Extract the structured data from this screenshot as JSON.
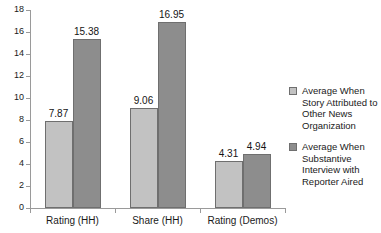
{
  "chart_data": {
    "type": "bar",
    "title": "",
    "subtitle": "",
    "xlabel": "",
    "ylabel": "",
    "categories": [
      "Rating (HH)",
      "Share (HH)",
      "Rating (Demos)"
    ],
    "series": [
      {
        "name": "Average When Story Attributed to Other News Organization",
        "color": "#c2c2c2",
        "values": [
          7.87,
          9.06,
          4.31
        ],
        "labels": [
          "7.87",
          "9.06",
          "4.31"
        ]
      },
      {
        "name": "Average When Substantive Interview with Reporter Aired",
        "color": "#8d8d8d",
        "values": [
          15.38,
          16.95,
          4.94
        ],
        "labels": [
          "15.38",
          "16.95",
          "4.94"
        ]
      }
    ],
    "ylim": [
      0,
      18
    ],
    "ytick_labels": [
      "0",
      "2",
      "4",
      "6",
      "8",
      "10",
      "12",
      "14",
      "16",
      "18"
    ],
    "ytick_values": [
      0,
      2,
      4,
      6,
      8,
      10,
      12,
      14,
      16,
      18
    ],
    "grid": false,
    "legend_position": "right"
  },
  "axis": {
    "ticks": [
      {
        "label": "18",
        "value": 18
      },
      {
        "label": "16",
        "value": 16
      },
      {
        "label": "14",
        "value": 14
      },
      {
        "label": "12",
        "value": 12
      },
      {
        "label": "10",
        "value": 10
      },
      {
        "label": "8",
        "value": 8
      },
      {
        "label": "6",
        "value": 6
      },
      {
        "label": "4",
        "value": 4
      },
      {
        "label": "2",
        "value": 2
      },
      {
        "label": "0",
        "value": 0
      }
    ]
  },
  "categories": [
    {
      "label": "Rating (HH)"
    },
    {
      "label": "Share (HH)"
    },
    {
      "label": "Rating (Demos)"
    }
  ],
  "bars": [
    {
      "label": "7.87"
    },
    {
      "label": "9.06"
    },
    {
      "label": "15.38"
    },
    {
      "label": "16.95"
    },
    {
      "label": "4.31"
    },
    {
      "label": "4.94"
    }
  ],
  "legend": {
    "items": [
      {
        "label": "Average When Story Attributed to Other News Organization",
        "color": "#c2c2c2"
      },
      {
        "label": "Average When Substantive Interview with Reporter Aired",
        "color": "#8d8d8d"
      }
    ]
  }
}
